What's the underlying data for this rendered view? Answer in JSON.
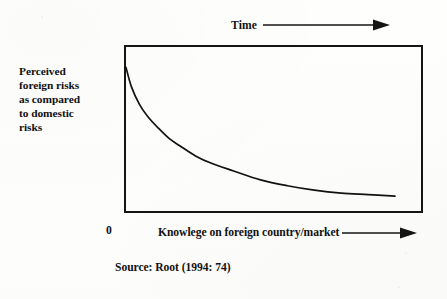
{
  "figure": {
    "y_axis_label_lines": [
      "Perceived",
      "foreign risks",
      "as compared",
      "to domestic",
      "risks"
    ],
    "top_annotation_label": "Time",
    "x_origin_label": "0",
    "x_axis_label": "Knowlege on foreign country/market",
    "source_caption": "Source: Root (1994: 74)",
    "colors": {
      "ink": "#151515",
      "paper": "#fdfdfc",
      "curve": "#121212"
    }
  },
  "chart_data": {
    "type": "line",
    "title": "",
    "subtitle": "",
    "xlabel": "Knowlege on foreign country/market",
    "ylabel": "Perceived foreign risks as compared to domestic risks",
    "xlim": [
      0,
      100
    ],
    "ylim": [
      0,
      100
    ],
    "grid": false,
    "legend": "none",
    "axis_ticks_shown": false,
    "annotations": [
      {
        "text": "Time",
        "position": "above-plot",
        "arrow": "right"
      },
      {
        "text": "0",
        "position": "x-origin"
      },
      {
        "text": "Knowlege on foreign country/market",
        "position": "below-plot",
        "arrow": "right"
      },
      {
        "text": "Source: Root (1994: 74)",
        "position": "figure-caption"
      }
    ],
    "series": [
      {
        "name": "Perceived foreign risk",
        "description": "Monotonically decreasing convex decay: perceived foreign risk falls steeply as knowledge of the foreign country/market increases, then asymptotes toward a low plateau.",
        "x": [
          0,
          2,
          5,
          8,
          12,
          16,
          20,
          26,
          32,
          40,
          50,
          60,
          70,
          80,
          90,
          100
        ],
        "y": [
          93,
          80,
          68,
          60,
          52,
          45,
          40,
          33,
          28,
          23,
          17,
          13,
          10,
          8,
          7,
          6
        ]
      }
    ]
  }
}
